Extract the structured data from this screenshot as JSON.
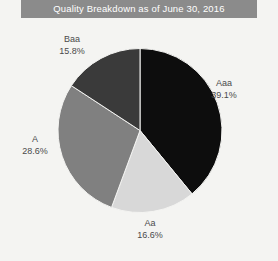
{
  "header": {
    "title": "Quality Breakdown as of June 30, 2016",
    "bar_color": "#8b8b8b",
    "text_color": "#ffffff"
  },
  "background_color": "#f4f4f2",
  "chart_data": {
    "type": "pie",
    "title": "Quality Breakdown as of June 30, 2016",
    "xlabel": "",
    "ylabel": "",
    "start_angle_deg": 0,
    "direction": "clockwise",
    "legend": "none",
    "grid": false,
    "categories": [
      "Aaa",
      "Aa",
      "A",
      "Baa"
    ],
    "values": [
      39.1,
      16.6,
      28.6,
      15.8
    ],
    "unit": "%",
    "colors": [
      "#0d0d0d",
      "#d8d8d8",
      "#808080",
      "#3a3a3a"
    ],
    "slices": [
      {
        "label": "Aaa",
        "value": 39.1,
        "value_text": "39.1%",
        "color": "#0d0d0d"
      },
      {
        "label": "Aa",
        "value": 16.6,
        "value_text": "16.6%",
        "color": "#d8d8d8"
      },
      {
        "label": "A",
        "value": 28.6,
        "value_text": "28.6%",
        "color": "#808080"
      },
      {
        "label": "Baa",
        "value": 15.8,
        "value_text": "15.8%",
        "color": "#3a3a3a"
      }
    ]
  }
}
